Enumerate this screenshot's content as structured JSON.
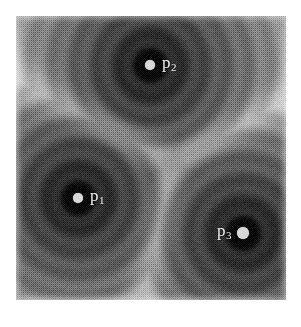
{
  "figure": {
    "background_color": "#ffffff",
    "plot": {
      "left": 16,
      "top": 16,
      "width": 270,
      "height": 284,
      "min_gray": "#0a0a0a",
      "mid_gray": "#8a8a8a",
      "max_gray": "#f0f0f0",
      "texture": "halftone-dither"
    }
  },
  "chart_data": {
    "type": "heatmap",
    "title": "",
    "subtitle": "",
    "xlabel": "",
    "ylabel": "",
    "grid": false,
    "legend": "none",
    "colormap": "grayscale",
    "axis_domain": {
      "x": [
        0,
        1
      ],
      "y": [
        0,
        1
      ]
    },
    "value_range": {
      "min_label": "near (dark)",
      "max_label": "far (light)"
    },
    "sites": [
      {
        "id": "p1",
        "label": "p",
        "subscript": "1",
        "x_px": 78,
        "y_px": 198,
        "x_norm": 0.23,
        "y_norm": 0.36,
        "dot_radius_px": 5,
        "basin_radius_px": 17,
        "label_offset_x_px": 12,
        "label_offset_y_px": -2,
        "label_side": "right",
        "dot_color": "#d8d8d8",
        "label_color": "#f2f2f2"
      },
      {
        "id": "p2",
        "label": "p",
        "subscript": "2",
        "x_px": 150,
        "y_px": 65,
        "x_norm": 0.5,
        "y_norm": 0.83,
        "dot_radius_px": 5,
        "basin_radius_px": 16,
        "label_offset_x_px": 12,
        "label_offset_y_px": -2,
        "label_side": "right",
        "dot_color": "#d8d8d8",
        "label_color": "#f2f2f2"
      },
      {
        "id": "p3",
        "label": "p",
        "subscript": "3",
        "x_px": 243,
        "y_px": 233,
        "x_norm": 0.84,
        "y_norm": 0.24,
        "dot_radius_px": 6,
        "basin_radius_px": 19,
        "label_offset_x_px": -26,
        "label_offset_y_px": -2,
        "label_side": "left",
        "dot_color": "#d8d8d8",
        "label_color": "#f2f2f2"
      }
    ],
    "ridges": [
      {
        "between": [
          "p1",
          "p2"
        ],
        "brightness": "light"
      },
      {
        "between": [
          "p2",
          "p3"
        ],
        "brightness": "light"
      },
      {
        "between": [
          "p1",
          "p3"
        ],
        "brightness": "light"
      }
    ],
    "bright_regions": [
      {
        "name": "top-right-corner",
        "x_norm": 0.95,
        "y_norm": 0.95
      },
      {
        "name": "top-left-corner",
        "x_norm": 0.04,
        "y_norm": 0.95
      },
      {
        "name": "bottom-center",
        "x_norm": 0.55,
        "y_norm": 0.02
      }
    ]
  }
}
